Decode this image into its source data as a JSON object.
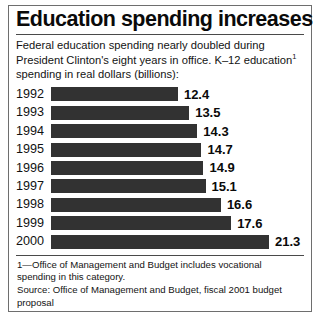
{
  "figure": {
    "title": "Education spending increases",
    "subtitle": "Federal education spending nearly doubled during President Clinton's eight years in office. K–12 education",
    "subtitle_footnote_marker": "1",
    "subtitle_tail": " spending in real dollars (billions):",
    "footnote": "1—Office of Management and Budget includes vocational spending in this category.",
    "source": "Source: Office of Management and Budget, fiscal 2001 budget proposal",
    "bar_color": "#323232",
    "border_color": "#6e6e6e"
  },
  "chart_data": {
    "type": "bar",
    "orientation": "horizontal",
    "title": "Education spending increases",
    "subtitle": "Federal education spending nearly doubled during President Clinton's eight years in office. K–12 education¹ spending in real dollars (billions):",
    "xlabel": "",
    "ylabel": "",
    "units": "billions of real dollars",
    "grid": false,
    "legend": false,
    "xlim": [
      0,
      21.3
    ],
    "categories": [
      "1992",
      "1993",
      "1994",
      "1995",
      "1996",
      "1997",
      "1998",
      "1999",
      "2000"
    ],
    "values": [
      12.4,
      13.5,
      14.3,
      14.7,
      14.9,
      15.1,
      16.6,
      17.6,
      21.3
    ],
    "value_labels": [
      "12.4",
      "13.5",
      "14.3",
      "14.7",
      "14.9",
      "15.1",
      "16.6",
      "17.6",
      "21.3"
    ],
    "annotations": [
      "1—Office of Management and Budget includes vocational spending in this category.",
      "Source: Office of Management and Budget, fiscal 2001 budget proposal"
    ]
  }
}
